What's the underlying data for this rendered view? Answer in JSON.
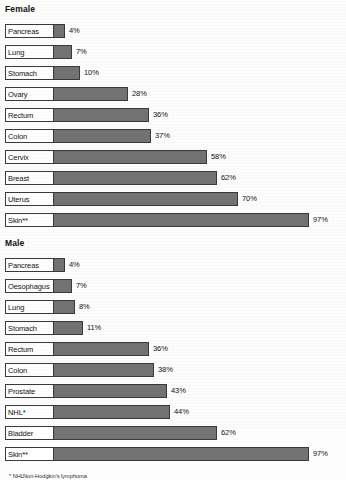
{
  "chart_data": {
    "type": "bar",
    "title": "",
    "xlabel": "",
    "ylabel": "",
    "xlim": [
      0,
      100
    ],
    "grid": false,
    "orientation": "horizontal",
    "value_suffix": "%",
    "groups": [
      {
        "name": "Female",
        "categories": [
          "Pancreas",
          "Lung",
          "Stomach",
          "Ovary",
          "Rectum",
          "Colon",
          "Cervix",
          "Breast",
          "Uterus",
          "Skin**"
        ],
        "values": [
          4,
          7,
          10,
          28,
          36,
          37,
          58,
          62,
          70,
          97
        ],
        "labels": [
          "4%",
          "7%",
          "10%",
          "28%",
          "36%",
          "37%",
          "58%",
          "62%",
          "70%",
          "97%"
        ]
      },
      {
        "name": "Male",
        "categories": [
          "Pancreas",
          "Oesophagus",
          "Lung",
          "Stomach",
          "Rectum",
          "Colon",
          "Prostate",
          "NHL*",
          "Bladder",
          "Skin**"
        ],
        "values": [
          4,
          7,
          8,
          11,
          36,
          38,
          43,
          44,
          62,
          97
        ],
        "labels": [
          "4%",
          "7%",
          "8%",
          "11%",
          "36%",
          "38%",
          "43%",
          "44%",
          "62%",
          "97%"
        ]
      }
    ],
    "footnotes": [
      {
        "mark": "* NHL",
        "text": "Non-Hodgkin's lymphoma"
      }
    ],
    "colors": {
      "bar_fill": "#737373",
      "bar_border": "#3a3a3a",
      "label_box_fill": "#ffffff",
      "background": "#fdfdfd",
      "text": "#141414"
    }
  }
}
